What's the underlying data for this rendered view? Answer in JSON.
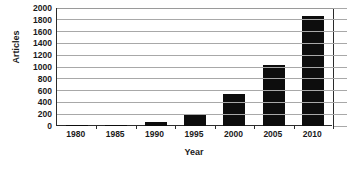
{
  "chart_data": {
    "type": "bar",
    "title": "",
    "xlabel": "Year",
    "ylabel": "Articles",
    "categories": [
      "1980",
      "1985",
      "1990",
      "1995",
      "2000",
      "2005",
      "2010"
    ],
    "values": [
      5,
      20,
      65,
      190,
      540,
      1040,
      1860
    ],
    "series": [
      {
        "name": "Articles",
        "values": [
          5,
          20,
          65,
          190,
          540,
          1040,
          1860
        ]
      }
    ],
    "ylim": [
      0,
      2000
    ],
    "ytick_step": 200,
    "yticks": [
      0,
      200,
      400,
      600,
      800,
      1000,
      1200,
      1400,
      1600,
      1800,
      2000
    ],
    "ytick_labels": [
      "0",
      "200",
      "400",
      "600",
      "800",
      "1000",
      "1200",
      "1400",
      "1600",
      "1800",
      "2000"
    ],
    "grid": true,
    "grid_axis": "y",
    "legend": false,
    "legend_position": "none",
    "bar_color": "#0d0d0d",
    "grid_color": "#a8a8a8",
    "axis_color": "#2b2b2b",
    "background_color": "#ffffff",
    "text_color": "#1a1a1a"
  }
}
